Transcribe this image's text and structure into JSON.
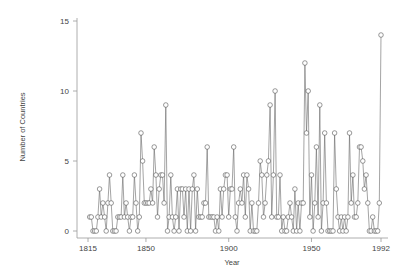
{
  "chart_data": {
    "type": "line",
    "title": "",
    "xlabel": "Year",
    "ylabel": "Number of Countries",
    "xlim": [
      1815,
      1992
    ],
    "ylim": [
      0,
      15
    ],
    "x_ticks": [
      1815,
      1850,
      1900,
      1950,
      1992
    ],
    "y_ticks": [
      0,
      5,
      10,
      15
    ],
    "grid": false,
    "legend": null,
    "marker": "hollow-circle",
    "line_color": "#555555",
    "series": [
      {
        "name": "Number of Countries",
        "x": [
          1816,
          1817,
          1818,
          1819,
          1820,
          1821,
          1822,
          1823,
          1824,
          1825,
          1826,
          1827,
          1828,
          1829,
          1830,
          1831,
          1832,
          1833,
          1834,
          1835,
          1836,
          1837,
          1838,
          1839,
          1840,
          1841,
          1842,
          1843,
          1844,
          1845,
          1846,
          1847,
          1848,
          1849,
          1850,
          1851,
          1852,
          1853,
          1854,
          1855,
          1856,
          1857,
          1858,
          1859,
          1860,
          1861,
          1862,
          1863,
          1864,
          1865,
          1866,
          1867,
          1868,
          1869,
          1870,
          1871,
          1872,
          1873,
          1874,
          1875,
          1876,
          1877,
          1878,
          1879,
          1880,
          1881,
          1882,
          1883,
          1884,
          1885,
          1886,
          1887,
          1888,
          1889,
          1890,
          1891,
          1892,
          1893,
          1894,
          1895,
          1896,
          1897,
          1898,
          1899,
          1900,
          1901,
          1902,
          1903,
          1904,
          1905,
          1906,
          1907,
          1908,
          1909,
          1910,
          1911,
          1912,
          1913,
          1914,
          1915,
          1916,
          1917,
          1918,
          1919,
          1920,
          1921,
          1922,
          1923,
          1924,
          1925,
          1926,
          1927,
          1928,
          1929,
          1930,
          1931,
          1932,
          1933,
          1934,
          1935,
          1936,
          1937,
          1938,
          1939,
          1940,
          1941,
          1942,
          1943,
          1944,
          1945,
          1946,
          1947,
          1948,
          1949,
          1950,
          1951,
          1952,
          1953,
          1954,
          1955,
          1956,
          1957,
          1958,
          1959,
          1960,
          1961,
          1962,
          1963,
          1964,
          1965,
          1966,
          1967,
          1968,
          1969,
          1970,
          1971,
          1972,
          1973,
          1974,
          1975,
          1976,
          1977,
          1978,
          1979,
          1980,
          1981,
          1982,
          1983,
          1984,
          1985,
          1986,
          1987,
          1988,
          1989,
          1990,
          1991,
          1992
        ],
        "values": [
          1,
          1,
          0,
          0,
          0,
          1,
          3,
          1,
          2,
          1,
          0,
          2,
          4,
          2,
          0,
          0,
          0,
          1,
          1,
          1,
          4,
          1,
          2,
          1,
          0,
          1,
          1,
          4,
          2,
          0,
          1,
          7,
          5,
          2,
          2,
          2,
          2,
          3,
          2,
          6,
          4,
          1,
          3,
          4,
          4,
          2,
          9,
          0,
          1,
          4,
          1,
          0,
          1,
          3,
          0,
          3,
          3,
          1,
          3,
          0,
          3,
          0,
          3,
          4,
          0,
          3,
          1,
          1,
          1,
          2,
          2,
          6,
          1,
          1,
          1,
          1,
          0,
          1,
          0,
          3,
          1,
          3,
          4,
          4,
          1,
          3,
          3,
          6,
          1,
          0,
          2,
          3,
          2,
          4,
          1,
          4,
          3,
          0,
          2,
          0,
          0,
          0,
          2,
          5,
          4,
          1,
          2,
          4,
          5,
          9,
          1,
          4,
          10,
          1,
          1,
          4,
          0,
          1,
          0,
          0,
          1,
          2,
          1,
          0,
          3,
          0,
          2,
          0,
          2,
          2,
          12,
          7,
          10,
          1,
          4,
          0,
          2,
          6,
          1,
          9,
          0,
          2,
          7,
          2,
          0,
          0,
          0,
          0,
          7,
          3,
          1,
          0,
          1,
          0,
          1,
          0,
          1,
          7,
          2,
          4,
          1,
          1,
          2,
          6,
          6,
          5,
          3,
          4,
          2,
          0,
          0,
          1,
          0,
          0,
          0,
          2,
          14
        ],
        "value_range_note": "values estimated from pixel positions"
      }
    ]
  }
}
